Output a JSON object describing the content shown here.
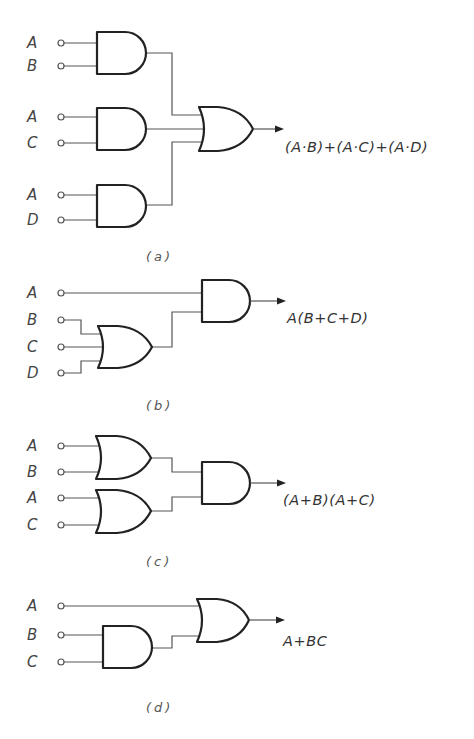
{
  "diagram": {
    "type": "logic-gate-circuits",
    "colors": {
      "ink": "#222222",
      "wire": "#555555",
      "label": "#444444",
      "background": "#ffffff"
    },
    "circuits": [
      {
        "id": "a",
        "caption": "(a)",
        "inputs": [
          "A",
          "B",
          "A",
          "C",
          "A",
          "D"
        ],
        "gates": [
          "AND",
          "AND",
          "AND",
          "OR"
        ],
        "output_expression": "(A·B)+(A·C)+(A·D)"
      },
      {
        "id": "b",
        "caption": "(b)",
        "inputs": [
          "A",
          "B",
          "C",
          "D"
        ],
        "gates": [
          "OR",
          "AND"
        ],
        "output_expression": "A(B+C+D)"
      },
      {
        "id": "c",
        "caption": "(c)",
        "inputs": [
          "A",
          "B",
          "A",
          "C"
        ],
        "gates": [
          "OR",
          "OR",
          "AND"
        ],
        "output_expression": "(A+B)(A+C)"
      },
      {
        "id": "d",
        "caption": "(d)",
        "inputs": [
          "A",
          "B",
          "C"
        ],
        "gates": [
          "AND",
          "OR"
        ],
        "output_expression": "A+BC"
      }
    ]
  }
}
